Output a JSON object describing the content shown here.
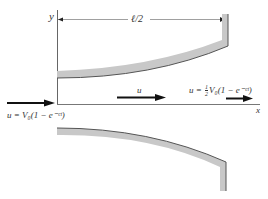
{
  "diagram": {
    "axes": {
      "y_label": "y",
      "x_label": "x"
    },
    "dimension": {
      "label": "ℓ/2"
    },
    "flow": {
      "inlet_label": "u = V₀(1 − e⁻ᶜᵗ)",
      "middle_label": "u",
      "outlet_label_prefix": "u = ",
      "outlet_label_frac_num": "1",
      "outlet_label_frac_den": "2",
      "outlet_label_suffix": "V₀(1 − e⁻ᶜᵗ)"
    },
    "colors": {
      "wall_fill": "#c8c8c8",
      "wall_edge": "#555555",
      "axis": "#666666",
      "arrow": "#111111",
      "text": "#333333"
    }
  }
}
